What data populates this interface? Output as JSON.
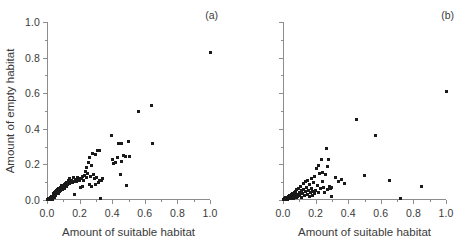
{
  "chart_data": [
    {
      "type": "scatter",
      "panel": "(a)",
      "title": "",
      "xlabel": "Amount of suitable habitat",
      "ylabel": "Amount of empty habitat",
      "xlim": [
        0.0,
        1.0
      ],
      "ylim": [
        0.0,
        1.0
      ],
      "xticks": [
        0.0,
        0.2,
        0.4,
        0.6,
        0.8,
        1.0
      ],
      "xticklabels": [
        "0.0",
        "0.2",
        "0.4",
        "0.6",
        "0.8",
        "1.0"
      ],
      "yticks": [
        0.0,
        0.2,
        0.4,
        0.6,
        0.8,
        1.0
      ],
      "yticklabels": [
        "0.0",
        "0.2",
        "0.4",
        "0.6",
        "0.8",
        "1.0"
      ],
      "grid": false,
      "legend": false,
      "marker": "square",
      "marker_color": "#1a1a1a",
      "points": [
        [
          0.005,
          0.004
        ],
        [
          0.01,
          0.003
        ],
        [
          0.012,
          0.01
        ],
        [
          0.015,
          0.006
        ],
        [
          0.018,
          0.002
        ],
        [
          0.02,
          0.012
        ],
        [
          0.022,
          0.005
        ],
        [
          0.025,
          0.018
        ],
        [
          0.028,
          0.008
        ],
        [
          0.03,
          0.022
        ],
        [
          0.032,
          0.014
        ],
        [
          0.035,
          0.004
        ],
        [
          0.038,
          0.028
        ],
        [
          0.04,
          0.02
        ],
        [
          0.042,
          0.034
        ],
        [
          0.045,
          0.012
        ],
        [
          0.048,
          0.04
        ],
        [
          0.05,
          0.03
        ],
        [
          0.052,
          0.046
        ],
        [
          0.055,
          0.024
        ],
        [
          0.058,
          0.052
        ],
        [
          0.06,
          0.038
        ],
        [
          0.062,
          0.06
        ],
        [
          0.065,
          0.044
        ],
        [
          0.068,
          0.034
        ],
        [
          0.07,
          0.056
        ],
        [
          0.072,
          0.066
        ],
        [
          0.075,
          0.048
        ],
        [
          0.078,
          0.062
        ],
        [
          0.08,
          0.072
        ],
        [
          0.082,
          0.054
        ],
        [
          0.085,
          0.068
        ],
        [
          0.088,
          0.078
        ],
        [
          0.09,
          0.06
        ],
        [
          0.092,
          0.084
        ],
        [
          0.095,
          0.07
        ],
        [
          0.098,
          0.058
        ],
        [
          0.1,
          0.076
        ],
        [
          0.105,
          0.088
        ],
        [
          0.108,
          0.066
        ],
        [
          0.11,
          0.082
        ],
        [
          0.115,
          0.094
        ],
        [
          0.118,
          0.074
        ],
        [
          0.12,
          0.1
        ],
        [
          0.125,
          0.086
        ],
        [
          0.13,
          0.108
        ],
        [
          0.135,
          0.092
        ],
        [
          0.14,
          0.118
        ],
        [
          0.145,
          0.102
        ],
        [
          0.15,
          0.112
        ],
        [
          0.155,
          0.098
        ],
        [
          0.16,
          0.124
        ],
        [
          0.165,
          0.106
        ],
        [
          0.17,
          0.03
        ],
        [
          0.175,
          0.116
        ],
        [
          0.18,
          0.104
        ],
        [
          0.185,
          0.128
        ],
        [
          0.19,
          0.11
        ],
        [
          0.195,
          0.122
        ],
        [
          0.2,
          0.108
        ],
        [
          0.205,
          0.068
        ],
        [
          0.21,
          0.118
        ],
        [
          0.215,
          0.132
        ],
        [
          0.22,
          0.078
        ],
        [
          0.225,
          0.112
        ],
        [
          0.23,
          0.14
        ],
        [
          0.235,
          0.16
        ],
        [
          0.24,
          0.126
        ],
        [
          0.245,
          0.18
        ],
        [
          0.25,
          0.15
        ],
        [
          0.255,
          0.21
        ],
        [
          0.258,
          0.086
        ],
        [
          0.262,
          0.24
        ],
        [
          0.265,
          0.134
        ],
        [
          0.27,
          0.196
        ],
        [
          0.275,
          0.078
        ],
        [
          0.28,
          0.262
        ],
        [
          0.285,
          0.142
        ],
        [
          0.29,
          0.118
        ],
        [
          0.295,
          0.088
        ],
        [
          0.3,
          0.258
        ],
        [
          0.305,
          0.128
        ],
        [
          0.31,
          0.278
        ],
        [
          0.315,
          0.096
        ],
        [
          0.32,
          0.108
        ],
        [
          0.325,
          0.278
        ],
        [
          0.33,
          0.01
        ],
        [
          0.335,
          0.112
        ],
        [
          0.34,
          0.118
        ],
        [
          0.395,
          0.36
        ],
        [
          0.4,
          0.228
        ],
        [
          0.405,
          0.206
        ],
        [
          0.42,
          0.212
        ],
        [
          0.43,
          0.24
        ],
        [
          0.44,
          0.318
        ],
        [
          0.45,
          0.146
        ],
        [
          0.455,
          0.318
        ],
        [
          0.46,
          0.216
        ],
        [
          0.47,
          0.25
        ],
        [
          0.48,
          0.244
        ],
        [
          0.49,
          0.08
        ],
        [
          0.5,
          0.33
        ],
        [
          0.505,
          0.246
        ],
        [
          0.56,
          0.5
        ],
        [
          0.64,
          0.53
        ],
        [
          0.648,
          0.318
        ],
        [
          1.0,
          0.83
        ]
      ]
    },
    {
      "type": "scatter",
      "panel": "(b)",
      "title": "",
      "xlabel": "Amount of suitable habitat",
      "ylabel": "",
      "xlim": [
        0.0,
        1.0
      ],
      "ylim": [
        0.0,
        1.0
      ],
      "xticks": [
        0.0,
        0.2,
        0.4,
        0.6,
        0.8,
        1.0
      ],
      "xticklabels": [
        "0.0",
        "0.2",
        "0.4",
        "0.6",
        "0.8",
        "1.0"
      ],
      "yticks": [
        0.0,
        0.2,
        0.4,
        0.6,
        0.8,
        1.0
      ],
      "yticklabels": [
        "",
        "",
        "",
        "",
        "",
        ""
      ],
      "grid": false,
      "legend": false,
      "marker": "square",
      "marker_color": "#1a1a1a",
      "points": [
        [
          0.004,
          0.003
        ],
        [
          0.008,
          0.008
        ],
        [
          0.012,
          0.004
        ],
        [
          0.016,
          0.012
        ],
        [
          0.02,
          0.006
        ],
        [
          0.024,
          0.016
        ],
        [
          0.028,
          0.002
        ],
        [
          0.032,
          0.02
        ],
        [
          0.036,
          0.01
        ],
        [
          0.04,
          0.026
        ],
        [
          0.044,
          0.014
        ],
        [
          0.048,
          0.006
        ],
        [
          0.052,
          0.03
        ],
        [
          0.056,
          0.018
        ],
        [
          0.06,
          0.036
        ],
        [
          0.064,
          0.01
        ],
        [
          0.068,
          0.042
        ],
        [
          0.072,
          0.024
        ],
        [
          0.076,
          0.05
        ],
        [
          0.08,
          0.016
        ],
        [
          0.084,
          0.058
        ],
        [
          0.088,
          0.032
        ],
        [
          0.092,
          0.02
        ],
        [
          0.096,
          0.066
        ],
        [
          0.1,
          0.044
        ],
        [
          0.104,
          0.028
        ],
        [
          0.108,
          0.074
        ],
        [
          0.112,
          0.052
        ],
        [
          0.116,
          0.014
        ],
        [
          0.12,
          0.038
        ],
        [
          0.124,
          0.09
        ],
        [
          0.128,
          0.06
        ],
        [
          0.132,
          0.024
        ],
        [
          0.136,
          0.104
        ],
        [
          0.14,
          0.046
        ],
        [
          0.144,
          0.07
        ],
        [
          0.148,
          0.03
        ],
        [
          0.152,
          0.112
        ],
        [
          0.156,
          0.054
        ],
        [
          0.16,
          0.018
        ],
        [
          0.164,
          0.086
        ],
        [
          0.168,
          0.04
        ],
        [
          0.172,
          0.118
        ],
        [
          0.176,
          0.062
        ],
        [
          0.18,
          0.026
        ],
        [
          0.184,
          0.048
        ],
        [
          0.188,
          0.098
        ],
        [
          0.192,
          0.034
        ],
        [
          0.196,
          0.13
        ],
        [
          0.2,
          0.056
        ],
        [
          0.205,
          0.176
        ],
        [
          0.21,
          0.08
        ],
        [
          0.215,
          0.044
        ],
        [
          0.22,
          0.196
        ],
        [
          0.225,
          0.148
        ],
        [
          0.23,
          0.062
        ],
        [
          0.235,
          0.23
        ],
        [
          0.24,
          0.106
        ],
        [
          0.245,
          0.152
        ],
        [
          0.25,
          0.07
        ],
        [
          0.255,
          0.04
        ],
        [
          0.26,
          0.142
        ],
        [
          0.265,
          0.29
        ],
        [
          0.27,
          0.058
        ],
        [
          0.275,
          0.186
        ],
        [
          0.28,
          0.228
        ],
        [
          0.285,
          0.074
        ],
        [
          0.29,
          0.066
        ],
        [
          0.295,
          0.022
        ],
        [
          0.3,
          0.068
        ],
        [
          0.32,
          0.126
        ],
        [
          0.34,
          0.104
        ],
        [
          0.36,
          0.116
        ],
        [
          0.375,
          0.094
        ],
        [
          0.45,
          0.45
        ],
        [
          0.5,
          0.14
        ],
        [
          0.57,
          0.36
        ],
        [
          0.655,
          0.108
        ],
        [
          0.72,
          0.01
        ],
        [
          0.85,
          0.078
        ],
        [
          1.0,
          0.608
        ]
      ]
    }
  ]
}
